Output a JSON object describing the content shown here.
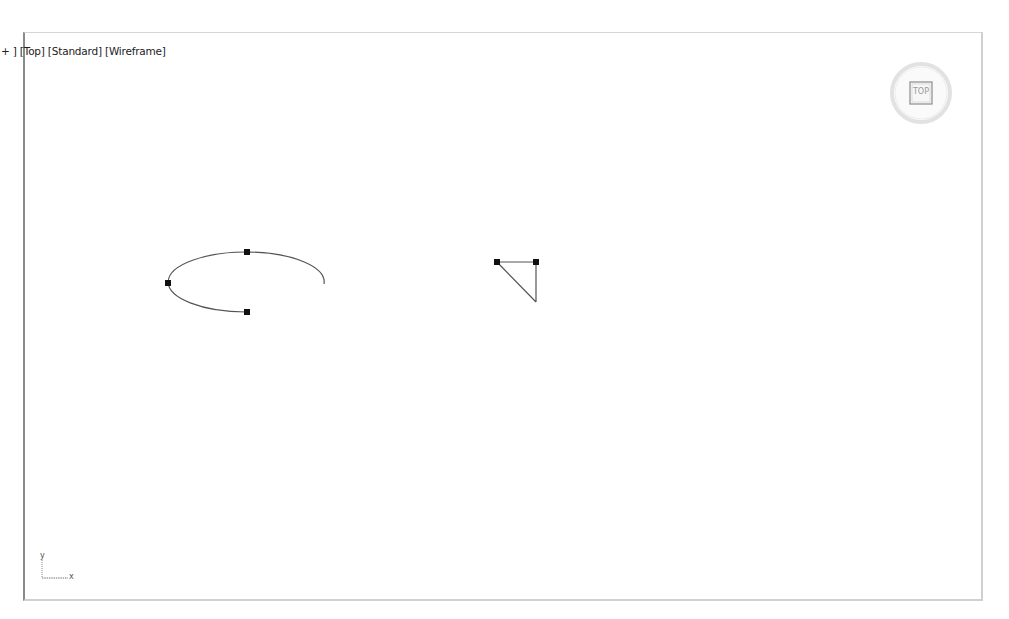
{
  "viewport": {
    "label": {
      "menu": "+",
      "view": "Top",
      "shading_mode": "Standard",
      "display_mode": "Wireframe",
      "separator_open": "[",
      "separator_close": "]"
    },
    "viewcube": {
      "face_label": "TOP"
    },
    "axis_tripod": {
      "y_label": "y",
      "x_label": "x",
      "z_label": "z"
    }
  },
  "scene": {
    "objects": [
      {
        "name": "arc-spline",
        "type": "ellipse-arc",
        "center": [
          247,
          282
        ],
        "radius_x": 78,
        "radius_y": 30,
        "vertices": [
          [
            168,
            283
          ],
          [
            247,
            252
          ],
          [
            247,
            312
          ]
        ],
        "open_end": [
          324,
          284
        ]
      },
      {
        "name": "triangle-spline",
        "type": "polyline",
        "vertices": [
          [
            497,
            262
          ],
          [
            536,
            262
          ]
        ],
        "open_end": [
          536,
          302
        ]
      }
    ],
    "colors": {
      "wire": "#555555",
      "vertex": "#111111",
      "background": "#ffffff"
    }
  }
}
